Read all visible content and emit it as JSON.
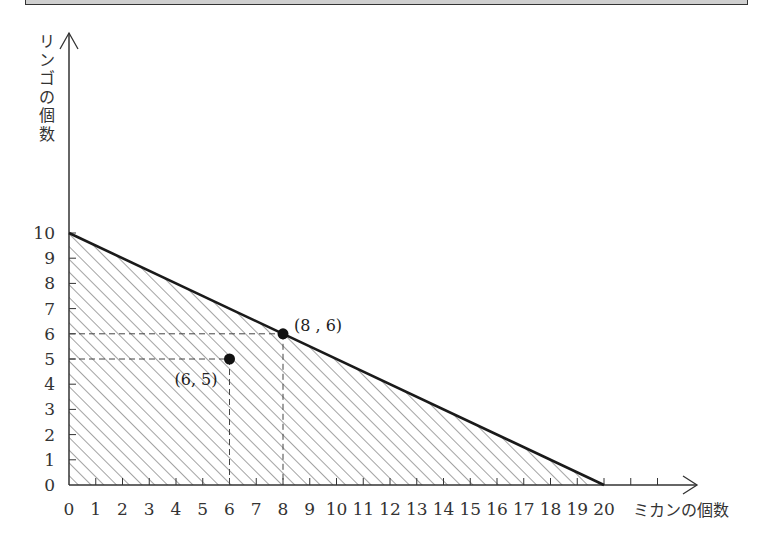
{
  "chart_data": {
    "type": "line",
    "title": "",
    "xlabel": "ミカンの個数",
    "ylabel": "リンゴの個数",
    "x_ticks": [
      0,
      1,
      2,
      3,
      4,
      5,
      6,
      7,
      8,
      9,
      10,
      11,
      12,
      13,
      14,
      15,
      16,
      17,
      18,
      19,
      20
    ],
    "y_ticks": [
      0,
      1,
      2,
      3,
      4,
      5,
      6,
      7,
      8,
      9,
      10
    ],
    "xlim": [
      0,
      22
    ],
    "ylim": [
      0,
      18
    ],
    "grid": false,
    "series": [
      {
        "name": "boundary",
        "x": [
          0,
          20
        ],
        "y": [
          10,
          0
        ],
        "style": "solid-thick",
        "shaded_region": "below line (hatched), x>=0, y>=0"
      }
    ],
    "points": [
      {
        "x": 8,
        "y": 6,
        "label": "(8 , 6)"
      },
      {
        "x": 6,
        "y": 5,
        "label": "(6, 5)"
      }
    ],
    "guides": "dashed lines from each point to both axes"
  },
  "labels": {
    "y_axis": [
      "リ",
      "ン",
      "ゴ",
      "の",
      "個",
      "数"
    ],
    "x_axis": "ミカンの個数",
    "point_a": "(8 , 6)",
    "point_b": "(6, 5)"
  },
  "colors": {
    "line": "#1a1a1a",
    "hatch": "#555555",
    "axis": "#333333",
    "top_bar": "#cfcfcf"
  }
}
